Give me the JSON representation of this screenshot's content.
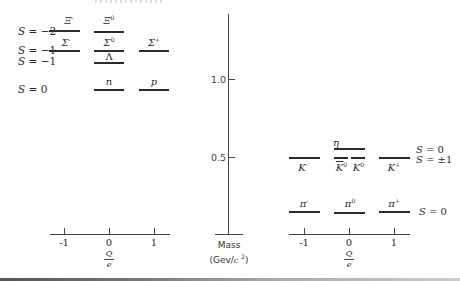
{
  "figure": {
    "mass_axis": {
      "label_line1": "Mass",
      "label_line2": "(Gev/c 2)",
      "ticks": [
        {
          "label": "1.0",
          "value": 1.0
        },
        {
          "label": "0.5",
          "value": 0.5
        }
      ]
    },
    "baryon_panel": {
      "charge_axis": {
        "ticks": [
          "-1",
          "0",
          "1"
        ],
        "label_num": "Q",
        "label_den": "e"
      },
      "strangeness_labels": [
        {
          "text": "S = -2"
        },
        {
          "text": "S = -1"
        },
        {
          "text": "S = -1"
        },
        {
          "text": "S = 0"
        }
      ],
      "particles": [
        {
          "symbol": "Ξ",
          "charge_sup": "-",
          "Q": -1,
          "S": -2
        },
        {
          "symbol": "Ξ",
          "charge_sup": "0",
          "Q": 0,
          "S": -2
        },
        {
          "symbol": "Σ",
          "charge_sup": "-",
          "Q": -1,
          "S": -1
        },
        {
          "symbol": "Σ",
          "charge_sup": "0",
          "Q": 0,
          "S": -1
        },
        {
          "symbol": "Σ",
          "charge_sup": "+",
          "Q": 1,
          "S": -1
        },
        {
          "symbol": "Λ",
          "charge_sup": "",
          "Q": 0,
          "S": -1
        },
        {
          "symbol": "n",
          "charge_sup": "",
          "Q": 0,
          "S": 0
        },
        {
          "symbol": "p",
          "charge_sup": "",
          "Q": 1,
          "S": 0
        }
      ]
    },
    "meson_panel": {
      "charge_axis": {
        "ticks": [
          "-1",
          "0",
          "1"
        ],
        "label_num": "Q",
        "label_den": "e"
      },
      "strangeness_labels": [
        {
          "text": "S = 0"
        },
        {
          "text": "S = ±1"
        },
        {
          "text": "S = 0"
        }
      ],
      "particles": [
        {
          "symbol": "η",
          "charge_sup": "",
          "Q": 0,
          "S": 0
        },
        {
          "symbol": "K",
          "charge_sup": "-",
          "Q": -1,
          "S": -1
        },
        {
          "symbol": "K̅",
          "charge_sup": "0",
          "Q": 0,
          "S": -1
        },
        {
          "symbol": "K",
          "charge_sup": "0",
          "Q": 0,
          "S": 1
        },
        {
          "symbol": "K",
          "charge_sup": "+",
          "Q": 1,
          "S": 1
        },
        {
          "symbol": "π",
          "charge_sup": "-",
          "Q": -1,
          "S": 0
        },
        {
          "symbol": "π",
          "charge_sup": "0",
          "Q": 0,
          "S": 0
        },
        {
          "symbol": "π",
          "charge_sup": "+",
          "Q": 1,
          "S": 0
        }
      ]
    }
  }
}
